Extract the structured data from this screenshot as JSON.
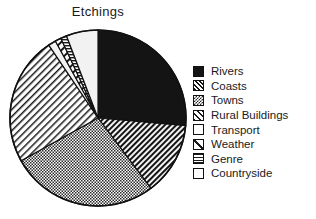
{
  "chart_data": {
    "type": "pie",
    "title": "Etchings",
    "xlabel": "",
    "ylabel": "",
    "legend_position": "right",
    "grid": false,
    "start_angle_deg": 0,
    "direction": "clockwise",
    "categories": [
      "Rivers",
      "Coasts",
      "Towns",
      "Rural Buildings",
      "Transport",
      "Weather",
      "Genre",
      "Countryside"
    ],
    "values": [
      26.4,
      13.3,
      27.2,
      23.6,
      1.4,
      1.1,
      1.1,
      5.9
    ],
    "angles_deg": [
      95,
      48,
      98,
      85,
      5,
      4,
      4,
      21
    ],
    "patterns": [
      "solid-black",
      "diagonal-hatch-dense",
      "checkerboard",
      "diagonal-hatch-wide",
      "white",
      "diagonal-slash",
      "horizontal-lines",
      "white"
    ]
  },
  "chart": {
    "title": "Etchings"
  },
  "legend": {
    "items": [
      {
        "label": "Rivers",
        "swatch": "solid-black-swatch"
      },
      {
        "label": "Coasts",
        "swatch": "diagonal-hatch-dense-swatch"
      },
      {
        "label": "Towns",
        "swatch": "checkerboard-swatch"
      },
      {
        "label": "Rural Buildings",
        "swatch": "diagonal-hatch-wide-swatch"
      },
      {
        "label": "Transport",
        "swatch": "white-swatch"
      },
      {
        "label": "Weather",
        "swatch": "diagonal-slash-swatch"
      },
      {
        "label": "Genre",
        "swatch": "horizontal-lines-swatch"
      },
      {
        "label": "Countryside",
        "swatch": "white-swatch"
      }
    ]
  },
  "colors": {
    "ink": "#111111",
    "paper": "#ffffff",
    "light_fill": "#ededed"
  }
}
